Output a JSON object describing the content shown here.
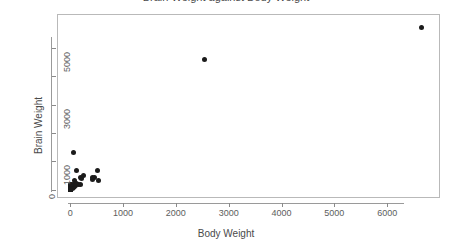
{
  "chart_data": {
    "type": "scatter",
    "title": "Brain Weight against Body Weight",
    "xlabel": "Body Weight",
    "ylabel": "Brain Weight",
    "xlim": [
      -250,
      7000
    ],
    "ylim": [
      -300,
      6200
    ],
    "xticks": [
      0,
      1000,
      2000,
      3000,
      4000,
      5000,
      6000
    ],
    "xticklabels": [
      "0",
      "1000",
      "2000",
      "3000",
      "4000",
      "5000",
      "6000"
    ],
    "yticks": [
      0,
      1000,
      2000,
      3000,
      4000,
      5000
    ],
    "yticklabels": [
      "0",
      "1000",
      "",
      "3000",
      "",
      "5000"
    ],
    "grid": false,
    "legend": false,
    "marker": "filled-circle",
    "marker_color": "#1b1b1b",
    "points": [
      {
        "x": 6654,
        "y": 5712
      },
      {
        "x": 2547,
        "y": 4603
      },
      {
        "x": 62,
        "y": 1320
      },
      {
        "x": 521,
        "y": 655
      },
      {
        "x": 465,
        "y": 423
      },
      {
        "x": 187,
        "y": 419
      },
      {
        "x": 207,
        "y": 406
      },
      {
        "x": 192,
        "y": 180
      },
      {
        "x": 250,
        "y": 490
      },
      {
        "x": 160,
        "y": 169
      },
      {
        "x": 529,
        "y": 325
      },
      {
        "x": 419,
        "y": 365
      },
      {
        "x": 423,
        "y": 420
      },
      {
        "x": 119,
        "y": 655
      },
      {
        "x": 85,
        "y": 325
      },
      {
        "x": 36,
        "y": 120
      },
      {
        "x": 28,
        "y": 115
      },
      {
        "x": 55,
        "y": 175
      },
      {
        "x": 100,
        "y": 157
      },
      {
        "x": 82,
        "y": 98
      },
      {
        "x": 115,
        "y": 220
      },
      {
        "x": 10,
        "y": 115
      },
      {
        "x": 3,
        "y": 25
      },
      {
        "x": 17,
        "y": 98
      },
      {
        "x": 27,
        "y": 115
      },
      {
        "x": 1,
        "y": 11
      },
      {
        "x": 12,
        "y": 50
      },
      {
        "x": 35,
        "y": 56
      },
      {
        "x": 6,
        "y": 40
      },
      {
        "x": 2,
        "y": 13
      },
      {
        "x": 4,
        "y": 25
      },
      {
        "x": 0.9,
        "y": 3
      },
      {
        "x": 0.4,
        "y": 0.4
      },
      {
        "x": 0.2,
        "y": 1.9
      },
      {
        "x": 3,
        "y": 4
      },
      {
        "x": 1,
        "y": 6
      },
      {
        "x": 0.1,
        "y": 0.3
      },
      {
        "x": 2,
        "y": 12
      },
      {
        "x": 4,
        "y": 20
      },
      {
        "x": 0.8,
        "y": 2
      },
      {
        "x": 0.3,
        "y": 1
      },
      {
        "x": 7,
        "y": 50
      },
      {
        "x": 14,
        "y": 98
      },
      {
        "x": 21,
        "y": 80
      },
      {
        "x": 60,
        "y": 81
      },
      {
        "x": 45,
        "y": 50
      },
      {
        "x": 50,
        "y": 140
      },
      {
        "x": 10,
        "y": 157
      },
      {
        "x": 6,
        "y": 45
      },
      {
        "x": 25,
        "y": 68
      },
      {
        "x": 0.05,
        "y": 0.14
      },
      {
        "x": 0.02,
        "y": 0.4
      },
      {
        "x": 1.4,
        "y": 12
      },
      {
        "x": 2.5,
        "y": 12
      },
      {
        "x": 55,
        "y": 100
      },
      {
        "x": 100,
        "y": 180
      },
      {
        "x": 3.3,
        "y": 25
      },
      {
        "x": 0.6,
        "y": 2
      },
      {
        "x": 9,
        "y": 180
      },
      {
        "x": 30,
        "y": 180
      }
    ]
  }
}
